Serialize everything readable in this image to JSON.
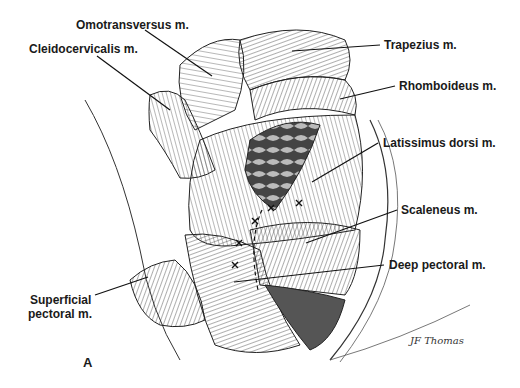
{
  "figure": {
    "panel_letter": "A",
    "signature": "JF Thomas",
    "labels": [
      {
        "id": "omotransversus",
        "text": "Omotransversus m."
      },
      {
        "id": "cleidocervicalis",
        "text": "Cleidocervicalis m."
      },
      {
        "id": "trapezius",
        "text": "Trapezius m."
      },
      {
        "id": "rhomboideus",
        "text": "Rhomboideus m."
      },
      {
        "id": "latissimus",
        "text": "Latissimus dorsi m."
      },
      {
        "id": "scaleneus",
        "text": "Scaleneus m."
      },
      {
        "id": "deep-pectoral",
        "text": "Deep pectoral m."
      },
      {
        "id": "superficial-pectoral-1",
        "text": "Superficial"
      },
      {
        "id": "superficial-pectoral-2",
        "text": "pectoral m."
      }
    ]
  }
}
